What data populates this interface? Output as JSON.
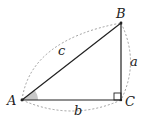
{
  "diagram": {
    "type": "right-triangle",
    "vertices": {
      "A": {
        "label": "A",
        "x": 22,
        "y": 100
      },
      "B": {
        "label": "B",
        "x": 121,
        "y": 23
      },
      "C": {
        "label": "C",
        "x": 121,
        "y": 100
      }
    },
    "sides": {
      "a": {
        "label": "a",
        "between": [
          "B",
          "C"
        ]
      },
      "b": {
        "label": "b",
        "between": [
          "A",
          "C"
        ]
      },
      "c": {
        "label": "c",
        "between": [
          "A",
          "B"
        ]
      }
    },
    "right_angle_at": "C",
    "shaded_angle_at": "A",
    "colors": {
      "line": "#222222",
      "dashed": "#888888",
      "angle_fill": "#c8c8c8"
    }
  }
}
